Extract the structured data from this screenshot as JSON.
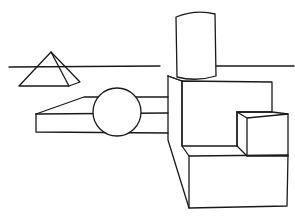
{
  "drawing": {
    "subject": "line drawing of geometric solids",
    "stroke_color": "#1a1a1a",
    "background_color": "#ffffff",
    "shapes": [
      "horizon-line",
      "pyramid",
      "flat-slab",
      "sphere",
      "large-box",
      "cylinder",
      "small-cube",
      "lower-step-block"
    ]
  }
}
